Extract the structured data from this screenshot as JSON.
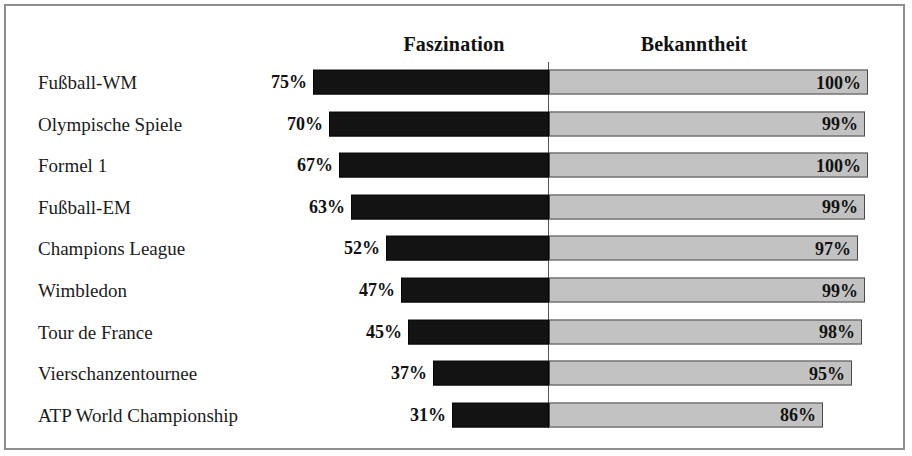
{
  "frame": {
    "border_color": "#8d8d8d"
  },
  "headers": {
    "left_column": "Faszination",
    "right_column": "Bekanntheit"
  },
  "colors": {
    "left_bar": "#131313",
    "right_bar_fill": "#c2c2c2",
    "right_bar_border": "#4a4a4a",
    "divider": "#545454",
    "text": "#1b1b1b"
  },
  "chart_data": {
    "type": "bar",
    "title": "",
    "subtitle": "",
    "xlabel": "",
    "ylabel": "",
    "orientation": "horizontal",
    "layout": "diverging-back-to-back",
    "grid": false,
    "legend_position": "top-as-column-headers",
    "axis_range_left": [
      0,
      100
    ],
    "axis_range_right": [
      0,
      100
    ],
    "categories": [
      "Fußball-WM",
      "Olympische Spiele",
      "Formel 1",
      "Fußball-EM",
      "Champions League",
      "Wimbledon",
      "Tour de France",
      "Vierschanzentournee",
      "ATP World Championship"
    ],
    "series": [
      {
        "name": "Faszination",
        "side": "left",
        "unit": "%",
        "values": [
          75,
          70,
          67,
          63,
          52,
          47,
          45,
          37,
          31
        ],
        "labels": [
          "75%",
          "70%",
          "67%",
          "63%",
          "52%",
          "47%",
          "45%",
          "37%",
          "31%"
        ]
      },
      {
        "name": "Bekanntheit",
        "side": "right",
        "unit": "%",
        "values": [
          100,
          99,
          100,
          99,
          97,
          99,
          98,
          95,
          86
        ],
        "labels": [
          "100%",
          "99%",
          "100%",
          "99%",
          "97%",
          "99%",
          "98%",
          "95%",
          "86%"
        ]
      }
    ]
  }
}
